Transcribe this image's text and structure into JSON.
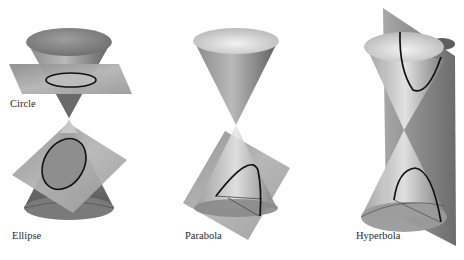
{
  "figure": {
    "panels": [
      {
        "id": "circle",
        "label": "Circle",
        "description": "Horizontal plane cuts the upper nappe perpendicular to the axis"
      },
      {
        "id": "ellipse",
        "label": "Ellipse",
        "description": "Tilted plane cuts one nappe completely"
      },
      {
        "id": "parabola",
        "label": "Parabola",
        "description": "Plane parallel to a generating line cuts one nappe"
      },
      {
        "id": "hyperbola",
        "label": "Hyperbola",
        "description": "Vertical plane cuts both nappes"
      }
    ]
  },
  "colors": {
    "background": "#ffffff",
    "cone_dark": "#6e6e6e",
    "cone_light": "#d8d8d8",
    "plane_dark": "#7a7a7a",
    "plane_light": "#c4c4c4",
    "curve": "#111111",
    "label_text": "#2a2a2a"
  }
}
